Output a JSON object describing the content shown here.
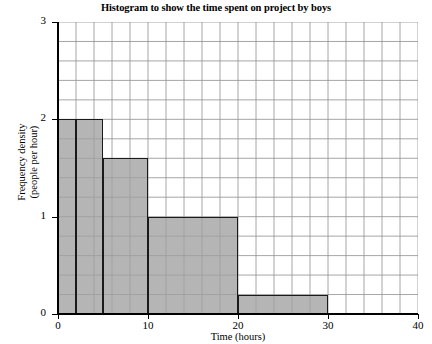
{
  "chart_data": {
    "type": "bar",
    "title": "Histogram to show the time spent on project by boys",
    "xlabel": "Time (hours)",
    "ylabel": "Frequency density (people per hour)",
    "ylabel_line1": "Frequency density",
    "ylabel_line2": "(people per hour)",
    "xlim": [
      0,
      40
    ],
    "ylim": [
      0,
      3
    ],
    "x_ticks": [
      0,
      10,
      20,
      30,
      40
    ],
    "x_tick_labels": [
      "0",
      "10",
      "20",
      "30",
      "40"
    ],
    "y_ticks": [
      0,
      1,
      2,
      3
    ],
    "y_tick_labels": [
      "0",
      "1",
      "2",
      "3"
    ],
    "grid": true,
    "grid_x_step": 2,
    "grid_y_step": 0.2,
    "legend": null,
    "bar_fill_color": "#a0a0a0",
    "bar_edge_color": "#1a1a1a",
    "bins": [
      {
        "start": 0,
        "end": 2,
        "frequency_density": 2.0,
        "frequency": 4
      },
      {
        "start": 2,
        "end": 5,
        "frequency_density": 2.0,
        "frequency": 6
      },
      {
        "start": 5,
        "end": 10,
        "frequency_density": 1.6,
        "frequency": 8
      },
      {
        "start": 10,
        "end": 20,
        "frequency_density": 1.0,
        "frequency": 10
      },
      {
        "start": 20,
        "end": 30,
        "frequency_density": 0.2,
        "frequency": 2
      }
    ],
    "categories": [
      "0-2",
      "2-5",
      "5-10",
      "10-20",
      "20-30"
    ],
    "values": [
      2.0,
      2.0,
      1.6,
      1.0,
      0.2
    ]
  }
}
